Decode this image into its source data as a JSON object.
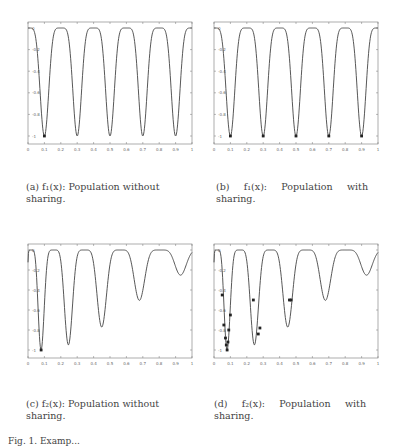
{
  "figure": {
    "subfigures": [
      {
        "id": "a",
        "caption": "(a) f₁(x): Population without sharing.",
        "func": "f1",
        "sharing": false
      },
      {
        "id": "b",
        "caption": "(b) f₁(x): Population with sharing.",
        "func": "f1",
        "sharing": true
      },
      {
        "id": "c",
        "caption": "(c) f₂(x): Population without sharing.",
        "func": "f2",
        "sharing": false
      },
      {
        "id": "d",
        "caption": "(d) f₂(x): Population with sharing.",
        "func": "f2",
        "sharing": true
      }
    ],
    "figure_caption": "Fig. 1. Examp..."
  },
  "chart_data": [
    {
      "type": "line",
      "title": "(a) f1(x): Population without sharing.",
      "x": [
        0,
        0.1,
        0.2,
        0.3,
        0.4,
        0.5,
        0.6,
        0.7,
        0.8,
        0.9,
        1
      ],
      "xlim": [
        0,
        1
      ],
      "ylim": [
        -1,
        0
      ],
      "xticks": [
        "0",
        "0.1",
        "0.2",
        "0.3",
        "0.4",
        "0.5",
        "0.6",
        "0.7",
        "0.8",
        "0.9",
        "1"
      ],
      "yticks": [
        "0",
        "-0.2",
        "-0.4",
        "-0.6",
        "-0.8",
        "-1"
      ],
      "series": [
        {
          "name": "f1",
          "description": "5 equal minima of -1 at x≈0.1,0.3,0.5,0.7,0.9"
        }
      ],
      "population_points": [
        [
          0.1,
          -1
        ]
      ]
    },
    {
      "type": "line",
      "title": "(b) f1(x): Population with sharing.",
      "x": [
        0,
        0.1,
        0.2,
        0.3,
        0.4,
        0.5,
        0.6,
        0.7,
        0.8,
        0.9,
        1
      ],
      "xlim": [
        0,
        1
      ],
      "ylim": [
        -1,
        0
      ],
      "xticks": [
        "0",
        "0.1",
        "0.2",
        "0.3",
        "0.4",
        "0.5",
        "0.6",
        "0.7",
        "0.8",
        "0.9",
        "1"
      ],
      "yticks": [
        "0",
        "-0.2",
        "-0.4",
        "-0.6",
        "-0.8",
        "-1"
      ],
      "series": [
        {
          "name": "f1"
        }
      ],
      "population_points": [
        [
          0.1,
          -1
        ],
        [
          0.3,
          -1
        ],
        [
          0.5,
          -1
        ],
        [
          0.7,
          -1
        ],
        [
          0.9,
          -1
        ]
      ]
    },
    {
      "type": "line",
      "title": "(c) f2(x): Population without sharing.",
      "xlim": [
        0,
        1
      ],
      "ylim": [
        -1,
        0
      ],
      "xticks": [
        "0",
        "0.1",
        "0.2",
        "0.3",
        "0.4",
        "0.5",
        "0.6",
        "0.7",
        "0.8",
        "0.9",
        "1"
      ],
      "yticks": [
        "0",
        "-0.2",
        "-0.4",
        "-0.6",
        "-0.8",
        "-1"
      ],
      "series": [
        {
          "name": "f2",
          "minima": [
            [
              0.08,
              -1
            ],
            [
              0.27,
              -0.85
            ],
            [
              0.46,
              -0.52
            ],
            [
              0.66,
              -0.23
            ],
            [
              0.85,
              -0.07
            ]
          ]
        }
      ],
      "population_points": [
        [
          0.08,
          -1
        ]
      ]
    },
    {
      "type": "line",
      "title": "(d) f2(x): Population with sharing.",
      "xlim": [
        0,
        1
      ],
      "ylim": [
        -1,
        0
      ],
      "xticks": [
        "0",
        "0.1",
        "0.2",
        "0.3",
        "0.4",
        "0.5",
        "0.6",
        "0.7",
        "0.8",
        "0.9",
        "1"
      ],
      "yticks": [
        "0",
        "-0.2",
        "-0.4",
        "-0.6",
        "-0.8",
        "-1"
      ],
      "series": [
        {
          "name": "f2",
          "minima": [
            [
              0.08,
              -1
            ],
            [
              0.27,
              -0.85
            ],
            [
              0.46,
              -0.52
            ],
            [
              0.66,
              -0.23
            ],
            [
              0.85,
              -0.07
            ]
          ]
        }
      ],
      "population_points": [
        [
          0.05,
          -0.45
        ],
        [
          0.06,
          -0.75
        ],
        [
          0.07,
          -0.88
        ],
        [
          0.075,
          -0.95
        ],
        [
          0.08,
          -1
        ],
        [
          0.085,
          -0.92
        ],
        [
          0.09,
          -0.8
        ],
        [
          0.1,
          -0.65
        ],
        [
          0.24,
          -0.5
        ],
        [
          0.27,
          -0.84
        ],
        [
          0.28,
          -0.78
        ],
        [
          0.46,
          -0.5
        ],
        [
          0.47,
          -0.5
        ]
      ]
    }
  ]
}
